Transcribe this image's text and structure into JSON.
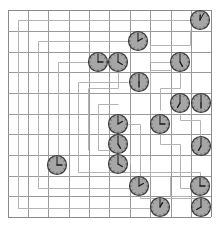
{
  "puzzle": {
    "grid": {
      "cols": 10,
      "rows": 10,
      "x_lines": [
        8,
        28,
        48,
        69,
        89,
        109,
        130,
        150,
        171,
        191,
        211
      ],
      "y_lines": [
        10,
        31,
        52,
        72,
        93,
        114,
        134,
        155,
        176,
        196,
        217
      ],
      "line_color": "#9a9a9a",
      "border_color": "#8a8a8a"
    },
    "paths": [
      {
        "id": "p1",
        "points": [
          [
            200,
            20
          ],
          [
            18,
            20
          ],
          [
            18,
            208
          ],
          [
            150,
            208
          ]
        ]
      },
      {
        "id": "p2",
        "points": [
          [
            138,
            41
          ],
          [
            38,
            41
          ],
          [
            38,
            188
          ],
          [
            130,
            188
          ]
        ]
      },
      {
        "id": "p3",
        "points": [
          [
            88,
            62
          ],
          [
            58,
            62
          ],
          [
            58,
            160
          ]
        ]
      },
      {
        "id": "p4",
        "points": [
          [
            128,
            82
          ],
          [
            78,
            82
          ],
          [
            78,
            172
          ],
          [
            200,
            172
          ],
          [
            200,
            176
          ]
        ]
      },
      {
        "id": "p5",
        "points": [
          [
            118,
            104
          ],
          [
            98,
            104
          ],
          [
            98,
            150
          ],
          [
            110,
            150
          ]
        ]
      },
      {
        "id": "p6",
        "points": [
          [
            170,
            62
          ],
          [
            150,
            62
          ],
          [
            150,
            45
          ],
          [
            190,
            45
          ],
          [
            190,
            30
          ]
        ]
      },
      {
        "id": "p7",
        "points": [
          [
            118,
            72
          ],
          [
            118,
            88
          ],
          [
            88,
            88
          ],
          [
            88,
            150
          ]
        ]
      },
      {
        "id": "p8",
        "points": [
          [
            150,
            92
          ],
          [
            150,
            70
          ],
          [
            170,
            70
          ]
        ]
      },
      {
        "id": "p9",
        "points": [
          [
            180,
            72
          ],
          [
            180,
            88
          ],
          [
            160,
            88
          ],
          [
            160,
            110
          ]
        ]
      },
      {
        "id": "p10",
        "points": [
          [
            128,
            124
          ],
          [
            140,
            124
          ],
          [
            140,
            198
          ],
          [
            198,
            198
          ]
        ]
      },
      {
        "id": "p11",
        "points": [
          [
            160,
            134
          ],
          [
            160,
            144
          ],
          [
            180,
            144
          ],
          [
            180,
            188
          ],
          [
            190,
            188
          ]
        ]
      },
      {
        "id": "p12",
        "points": [
          [
            180,
            113
          ],
          [
            180,
            120
          ],
          [
            200,
            120
          ],
          [
            200,
            136
          ]
        ]
      },
      {
        "id": "p13",
        "points": [
          [
            150,
            160
          ],
          [
            150,
            176
          ],
          [
            170,
            176
          ],
          [
            170,
            196
          ],
          [
            190,
            196
          ]
        ]
      },
      {
        "id": "p14",
        "points": [
          [
            130,
            155
          ],
          [
            130,
            164
          ]
        ]
      }
    ],
    "clocks": [
      {
        "id": "c1",
        "cx": 200,
        "cy": 20,
        "hour": 12,
        "minute": 5
      },
      {
        "id": "c2",
        "cx": 138,
        "cy": 41,
        "hour": 2,
        "minute": 0
      },
      {
        "id": "c3",
        "cx": 98,
        "cy": 62,
        "hour": 3,
        "minute": 0
      },
      {
        "id": "c4",
        "cx": 118,
        "cy": 62,
        "hour": 4,
        "minute": 0
      },
      {
        "id": "c5",
        "cx": 180,
        "cy": 62,
        "hour": 5,
        "minute": 0
      },
      {
        "id": "c6",
        "cx": 139,
        "cy": 82,
        "hour": 6,
        "minute": 0
      },
      {
        "id": "c7",
        "cx": 180,
        "cy": 103,
        "hour": 7,
        "minute": 0
      },
      {
        "id": "c8",
        "cx": 201,
        "cy": 103,
        "hour": 6,
        "minute": 0
      },
      {
        "id": "c9",
        "cx": 118,
        "cy": 124,
        "hour": 2,
        "minute": 0
      },
      {
        "id": "c10",
        "cx": 160,
        "cy": 124,
        "hour": 3,
        "minute": 0
      },
      {
        "id": "c11",
        "cx": 118,
        "cy": 144,
        "hour": 5,
        "minute": 0
      },
      {
        "id": "c12",
        "cx": 201,
        "cy": 146,
        "hour": 7,
        "minute": 0
      },
      {
        "id": "c13",
        "cx": 118,
        "cy": 164,
        "hour": 4,
        "minute": 0
      },
      {
        "id": "c14",
        "cx": 57,
        "cy": 165,
        "hour": 3,
        "minute": 0
      },
      {
        "id": "c15",
        "cx": 139,
        "cy": 186,
        "hour": 2,
        "minute": 0
      },
      {
        "id": "c16",
        "cx": 200,
        "cy": 186,
        "hour": 3,
        "minute": 0
      },
      {
        "id": "c17",
        "cx": 160,
        "cy": 207,
        "hour": 1,
        "minute": 0
      },
      {
        "id": "c18",
        "cx": 201,
        "cy": 207,
        "hour": 8,
        "minute": 0
      }
    ],
    "clock_style": {
      "radius": 9.5,
      "face_color": "#a6a6a6",
      "rim_color": "#3a3a3a",
      "hand_color": "#1a1a1a"
    },
    "path_color": "#b4b4b4"
  }
}
